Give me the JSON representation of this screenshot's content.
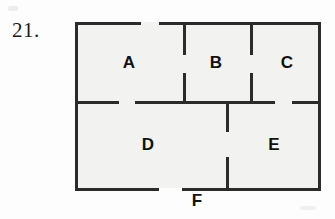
{
  "figure": {
    "problem_number": "21.",
    "kind": "floor-plan-with-doorways",
    "room_labels": [
      {
        "name": "A",
        "x": 129,
        "y": 62
      },
      {
        "name": "B",
        "x": 216,
        "y": 62
      },
      {
        "name": "C",
        "x": 287,
        "y": 62
      },
      {
        "name": "D",
        "x": 148,
        "y": 144
      },
      {
        "name": "E",
        "x": 274,
        "y": 144
      }
    ],
    "outside_labels": [
      {
        "name": "F",
        "x": 197,
        "y": 192
      }
    ],
    "colors": {
      "wall": "#2b2b2b",
      "room_fill": "#f2f2f0",
      "text": "#111111",
      "page": "#fdfdfd"
    },
    "outer_rect": {
      "x": 75,
      "y": 22,
      "width": 243,
      "height": 166
    },
    "walls": {
      "top": [
        {
          "x": 75,
          "y": 22,
          "length": 66
        },
        {
          "x": 159,
          "y": 22,
          "length": 159
        }
      ],
      "bottom": [
        {
          "x": 75,
          "y": 188,
          "length": 84
        },
        {
          "x": 182,
          "y": 188,
          "length": 136
        }
      ],
      "left": [
        {
          "x": 75,
          "y": 22,
          "length": 166
        }
      ],
      "right": [
        {
          "x": 318,
          "y": 22,
          "length": 166
        }
      ],
      "middle_horizontal": [
        {
          "x": 75,
          "y": 101,
          "length": 44
        },
        {
          "x": 135,
          "y": 101,
          "length": 140
        },
        {
          "x": 292,
          "y": 101,
          "length": 26
        }
      ],
      "vertical_ab": [
        {
          "x": 183,
          "y": 22,
          "length": 33
        },
        {
          "x": 183,
          "y": 73,
          "length": 29
        }
      ],
      "vertical_bc": [
        {
          "x": 250,
          "y": 22,
          "length": 33
        },
        {
          "x": 250,
          "y": 73,
          "length": 29
        }
      ],
      "vertical_de": [
        {
          "x": 226,
          "y": 101,
          "length": 31
        },
        {
          "x": 226,
          "y": 157,
          "length": 32
        }
      ]
    }
  }
}
